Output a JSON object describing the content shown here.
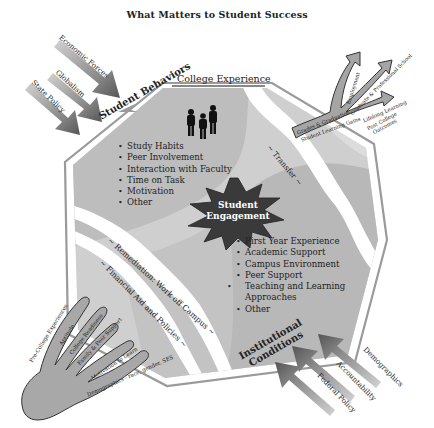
{
  "title": "What Matters to Student Success",
  "college_experience": {
    "label": "College Experience"
  },
  "student_behaviors": {
    "heading": "Student Behaviors",
    "items": [
      "Study Habits",
      "Peer Involvement",
      "Interaction with Faculty",
      "Time on Task",
      "Motivation",
      "Other"
    ],
    "icon": "people-silhouette-icon"
  },
  "student_engagement": {
    "line1": "Student",
    "line2": "Engagement"
  },
  "institutional_conditions": {
    "line1": "Institutional",
    "line2": "Conditions",
    "items": [
      "First Year Experience",
      "Academic Support",
      "Campus Environment",
      "Peer Support",
      "Teaching and Learning Approaches",
      "Other"
    ]
  },
  "streams": {
    "transfer": "~ Transfer ~",
    "remediation": "~ Remediation: Work off Campus ~",
    "financial_aid": "~ Financial Aid and Policies ~"
  },
  "external_forces_top": [
    "Economic Forces",
    "Globalism",
    "State Policy"
  ],
  "external_forces_bottom": [
    "Demographics",
    "Accountability",
    "Federal Policy"
  ],
  "post_college": {
    "label_line1": "Post College",
    "label_line2": "Outcomes",
    "base_line1": "Grades & Graduation",
    "base_line2": "Student Learning Gains",
    "branches": [
      "Employment",
      "Graduate & Professional School",
      "Lifelong Learning"
    ]
  },
  "pre_college": {
    "label": "Pre-College Experiences",
    "fingers": [
      "Aptitude",
      "College Readiness",
      "Family & Peer Support",
      "Motivation to Learn",
      "Demographics - race, gender, SES"
    ]
  },
  "colors": {
    "octagon_outline": "#9a9a9a",
    "region_dark": "#b3b3b3",
    "region_light": "#d0d0d0",
    "star_fill": "#3a3a3a",
    "arrow_dark": "#5e5e5e",
    "arrow_light": "#c8c8c8",
    "hand_fill": "#a8a8a8"
  }
}
